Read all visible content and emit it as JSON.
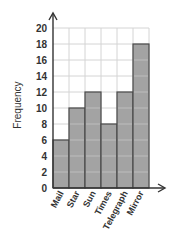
{
  "chart_data": {
    "type": "bar",
    "title": "",
    "xlabel": "",
    "ylabel": "Frequency",
    "categories": [
      "Mail",
      "Star",
      "Sun",
      "Times",
      "Telegraph",
      "Mirror"
    ],
    "values": [
      6,
      10,
      12,
      8,
      12,
      18
    ],
    "ylim": [
      0,
      20
    ],
    "yticks": [
      0,
      2,
      4,
      6,
      8,
      10,
      12,
      14,
      16,
      18,
      20
    ],
    "grid": true,
    "legend": null,
    "colors": {
      "bar_fill": "#a3a3a3",
      "bar_stroke": "#4a4a4a",
      "grid": "#d4d4d4",
      "axis": "#333333"
    }
  }
}
